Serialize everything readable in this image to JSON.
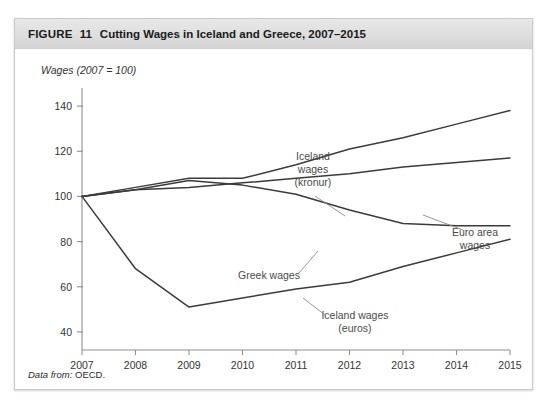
{
  "figure": {
    "caption_word": "FIGURE",
    "number": "11",
    "title": "Cutting Wages in Iceland and Greece, 2007–2015",
    "source_label": "Data from:",
    "source_value": "OECD."
  },
  "chart_data": {
    "type": "line",
    "title": "Cutting Wages in Iceland and Greece, 2007–2015",
    "xlabel": "",
    "ylabel": "Wages (2007 = 100)",
    "x": [
      2007,
      2008,
      2009,
      2010,
      2011,
      2012,
      2013,
      2014,
      2015
    ],
    "xtick_labels": [
      "2007",
      "2008",
      "2009",
      "2010",
      "2011",
      "2012",
      "2013",
      "2014",
      "2015"
    ],
    "ytick_labels": [
      "40",
      "60",
      "80",
      "100",
      "120",
      "140"
    ],
    "yticks": [
      40,
      60,
      80,
      100,
      120,
      140
    ],
    "ylim": [
      32,
      148
    ],
    "xlim": [
      2007,
      2015
    ],
    "grid": false,
    "legend": "annotations",
    "series": [
      {
        "name": "Iceland wages (kronur)",
        "values": [
          100,
          104,
          108,
          108,
          114,
          121,
          126,
          132,
          138
        ]
      },
      {
        "name": "Euro area wages",
        "values": [
          100,
          103,
          104,
          106,
          108,
          110,
          113,
          115,
          117
        ]
      },
      {
        "name": "Greek wages",
        "values": [
          100,
          103,
          107,
          105,
          101,
          94,
          88,
          87,
          87
        ]
      },
      {
        "name": "Iceland wages (euros)",
        "values": [
          100,
          68,
          51,
          55,
          59,
          62,
          69,
          75,
          81
        ]
      }
    ],
    "annotations": [
      {
        "name": "Iceland wages (kronur)",
        "lines": [
          "Iceland",
          "wages",
          "(kronur)"
        ]
      },
      {
        "name": "Euro area wages",
        "lines": [
          "Euro area",
          "wages"
        ]
      },
      {
        "name": "Greek wages",
        "lines": [
          "Greek wages"
        ]
      },
      {
        "name": "Iceland wages (euros)",
        "lines": [
          "Iceland wages",
          "(euros)"
        ]
      }
    ]
  },
  "colors": {
    "line": "#3b3b3b",
    "axis": "#8e8e8e",
    "header_band": "#dedede",
    "border": "#c9c9c9",
    "text": "#333333"
  }
}
